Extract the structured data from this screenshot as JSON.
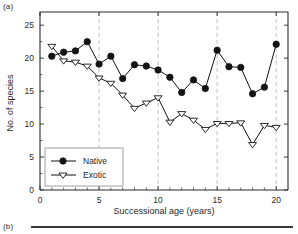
{
  "panels": {
    "a_label": "(a)",
    "b_label": "(b)"
  },
  "chart_data": {
    "type": "line",
    "title": "",
    "xlabel": "Successional age (years)",
    "ylabel": "No. of species",
    "xlim": [
      0,
      21
    ],
    "ylim": [
      0,
      27
    ],
    "xticks": [
      0,
      5,
      10,
      15,
      20
    ],
    "yticks": [
      0,
      5,
      10,
      15,
      20,
      25
    ],
    "xtick_labels": [
      "0",
      "5",
      "10",
      "15",
      "20"
    ],
    "ytick_labels": [
      "0",
      "5",
      "10",
      "15",
      "20",
      "25"
    ],
    "grid": "vertical-dashed-at-5-10-15-20",
    "legend_position": "lower-left",
    "x": [
      1,
      2,
      3,
      4,
      5,
      6,
      7,
      8,
      9,
      10,
      11,
      12,
      13,
      14,
      15,
      16,
      17,
      18,
      19,
      20
    ],
    "series": [
      {
        "name": "Native",
        "marker": "filled-circle",
        "values": [
          20.3,
          20.9,
          21.1,
          22.5,
          19.1,
          20.3,
          16.9,
          19.0,
          18.8,
          18.2,
          17.1,
          14.8,
          16.7,
          15.4,
          21.2,
          18.7,
          18.6,
          14.6,
          15.6,
          22.1
        ]
      },
      {
        "name": "Exotic",
        "marker": "open-down-triangle",
        "values": [
          21.8,
          19.6,
          19.4,
          18.8,
          17.0,
          16.2,
          14.4,
          12.4,
          13.2,
          14.0,
          10.3,
          11.6,
          10.6,
          9.2,
          10.1,
          10.1,
          10.2,
          6.9,
          9.8,
          9.5
        ]
      }
    ],
    "colors": {
      "native": "#141414",
      "exotic": "#ffffff",
      "line": "#111111",
      "grid": "#b9b9b9",
      "axis": "#2b2b2b"
    }
  }
}
